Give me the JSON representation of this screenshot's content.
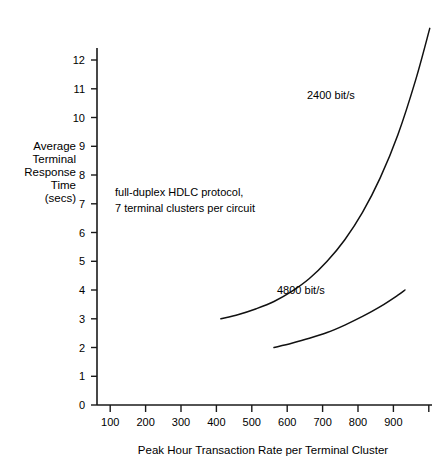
{
  "chart_data": {
    "type": "line",
    "title": "",
    "xlabel": "Peak Hour Transaction Rate per Terminal Cluster",
    "ylabel": "Average Terminal Response Time (secs)",
    "ylabel_lines": [
      "Average",
      "Terminal",
      "Response",
      "Time",
      "(secs)"
    ],
    "xlim": [
      0,
      1030
    ],
    "ylim": [
      0,
      13.4
    ],
    "grid": false,
    "legend_position": "inline-annotations",
    "xticks": [
      100,
      200,
      300,
      400,
      500,
      600,
      700,
      800,
      900,
      1000
    ],
    "xtick_labels": [
      "100",
      "200",
      "300",
      "400",
      "500",
      "600",
      "700",
      "800",
      "900",
      ""
    ],
    "yticks": [
      0,
      1,
      2,
      3,
      4,
      5,
      6,
      7,
      8,
      9,
      10,
      11,
      12
    ],
    "ytick_labels": [
      "0",
      "1",
      "2",
      "3",
      "4",
      "5",
      "6",
      "7",
      "8",
      "9",
      "10",
      "11",
      "12"
    ],
    "annotations": [
      "full-duplex HDLC protocol,",
      "7 terminal clusters per circuit"
    ],
    "series": [
      {
        "name": "2400 bit/s",
        "label": "2400 bit/s",
        "color": "#111111",
        "x": [
          350,
          400,
          450,
          500,
          550,
          600,
          650,
          700,
          750,
          800,
          850,
          900,
          940
        ],
        "values": [
          3.0,
          3.15,
          3.35,
          3.6,
          3.95,
          4.4,
          5.0,
          5.75,
          6.7,
          7.9,
          9.4,
          11.3,
          13.1
        ]
      },
      {
        "name": "4800 bit/s",
        "label": "4800 bit/s",
        "color": "#111111",
        "x": [
          500,
          550,
          600,
          650,
          700,
          750,
          800,
          850,
          870
        ],
        "values": [
          2.0,
          2.15,
          2.32,
          2.52,
          2.78,
          3.08,
          3.42,
          3.82,
          4.0
        ]
      }
    ]
  },
  "axis": {
    "x_title": "Peak Hour Transaction Rate per Terminal Cluster",
    "y_title_lines": [
      "Average",
      "Terminal",
      "Response",
      "Time",
      "(secs)"
    ]
  },
  "labels": {
    "series_2400": "2400 bit/s",
    "series_4800": "4800 bit/s",
    "annotation_line1": "full-duplex HDLC protocol,",
    "annotation_line2": "7 terminal clusters per circuit"
  },
  "colors": {
    "ink": "#111111",
    "background": "#ffffff"
  }
}
